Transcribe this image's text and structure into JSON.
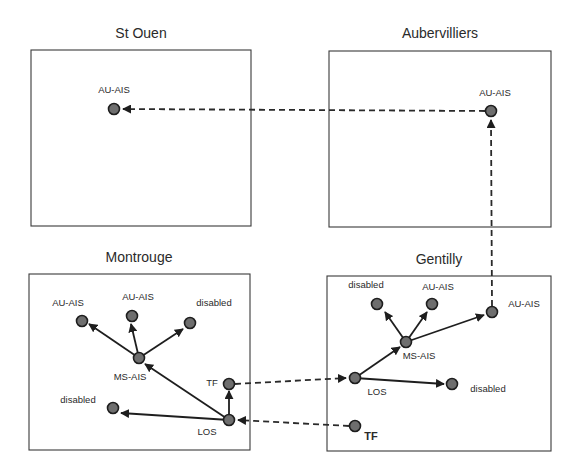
{
  "diagram": {
    "colors": {
      "node_fill": "#6e6e6e",
      "node_stroke": "#1e1e1e",
      "line": "#1e1e1e",
      "box_border": "#3a3a3a",
      "background": "#ffffff"
    },
    "sites": [
      {
        "id": "st-ouen",
        "title": "St Ouen",
        "nodes": [
          {
            "id": "so-au-ais",
            "label": "AU-AIS"
          }
        ]
      },
      {
        "id": "aubervilliers",
        "title": "Aubervilliers",
        "nodes": [
          {
            "id": "au-au-ais",
            "label": "AU-AIS"
          }
        ]
      },
      {
        "id": "montrouge",
        "title": "Montrouge",
        "nodes": [
          {
            "id": "mo-au-ais-1",
            "label": "AU-AIS"
          },
          {
            "id": "mo-au-ais-2",
            "label": "AU-AIS"
          },
          {
            "id": "mo-disabled-1",
            "label": "disabled"
          },
          {
            "id": "mo-ms-ais",
            "label": "MS-AIS"
          },
          {
            "id": "mo-tf",
            "label": "TF"
          },
          {
            "id": "mo-los",
            "label": "LOS"
          },
          {
            "id": "mo-disabled-2",
            "label": "disabled"
          }
        ]
      },
      {
        "id": "gentilly",
        "title": "Gentilly",
        "nodes": [
          {
            "id": "ge-disabled-1",
            "label": "disabled"
          },
          {
            "id": "ge-au-ais-1",
            "label": "AU-AIS"
          },
          {
            "id": "ge-au-ais-2",
            "label": "AU-AIS"
          },
          {
            "id": "ge-ms-ais",
            "label": "MS-AIS"
          },
          {
            "id": "ge-los",
            "label": "LOS"
          },
          {
            "id": "ge-disabled-2",
            "label": "disabled"
          },
          {
            "id": "ge-tf",
            "label": "TF"
          }
        ]
      }
    ],
    "edges": [
      {
        "from": "mo-los",
        "to": "mo-ms-ais",
        "style": "solid"
      },
      {
        "from": "mo-los",
        "to": "mo-tf",
        "style": "solid"
      },
      {
        "from": "mo-los",
        "to": "mo-disabled-2",
        "style": "solid"
      },
      {
        "from": "mo-ms-ais",
        "to": "mo-au-ais-1",
        "style": "solid"
      },
      {
        "from": "mo-ms-ais",
        "to": "mo-au-ais-2",
        "style": "solid"
      },
      {
        "from": "mo-ms-ais",
        "to": "mo-disabled-1",
        "style": "solid"
      },
      {
        "from": "mo-tf",
        "to": "ge-los",
        "style": "dashed"
      },
      {
        "from": "ge-tf",
        "to": "mo-los",
        "style": "dashed"
      },
      {
        "from": "ge-los",
        "to": "ge-ms-ais",
        "style": "solid"
      },
      {
        "from": "ge-los",
        "to": "ge-disabled-2",
        "style": "solid"
      },
      {
        "from": "ge-ms-ais",
        "to": "ge-disabled-1",
        "style": "solid"
      },
      {
        "from": "ge-ms-ais",
        "to": "ge-au-ais-1",
        "style": "solid"
      },
      {
        "from": "ge-ms-ais",
        "to": "ge-au-ais-2",
        "style": "solid"
      },
      {
        "from": "ge-au-ais-2",
        "to": "au-au-ais",
        "style": "dashed"
      },
      {
        "from": "au-au-ais",
        "to": "so-au-ais",
        "style": "dashed"
      }
    ]
  }
}
